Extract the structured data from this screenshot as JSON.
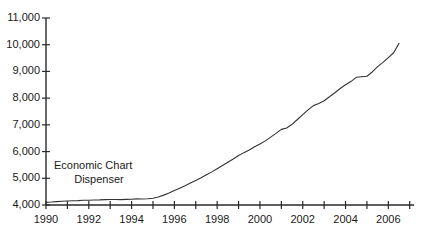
{
  "chart_data": {
    "type": "line",
    "title": "",
    "subtitle": "",
    "xlabel": "",
    "ylabel": "",
    "grid": false,
    "legend": null,
    "xlim": [
      1990,
      2007.2
    ],
    "ylim": [
      4000,
      11000
    ],
    "y_ticks": [
      4000,
      5000,
      6000,
      7000,
      8000,
      9000,
      10000,
      11000
    ],
    "y_tick_labels": [
      "4,000",
      "5,000",
      "6,000",
      "7,000",
      "8,000",
      "9,000",
      "10,000",
      "11,000"
    ],
    "x_ticks": [
      1990,
      1991,
      1992,
      1993,
      1994,
      1995,
      1996,
      1997,
      1998,
      1999,
      2000,
      2001,
      2002,
      2003,
      2004,
      2005,
      2006,
      2007
    ],
    "x_tick_labels": [
      {
        "value": 1990,
        "label": "1990"
      },
      {
        "value": 1992,
        "label": "1992"
      },
      {
        "value": 1994,
        "label": "1994"
      },
      {
        "value": 1996,
        "label": "1996"
      },
      {
        "value": 1998,
        "label": "1998"
      },
      {
        "value": 2000,
        "label": "2000"
      },
      {
        "value": 2002,
        "label": "2002"
      },
      {
        "value": 2004,
        "label": "2004"
      },
      {
        "value": 2006,
        "label": "2006"
      }
    ],
    "annotations": [
      {
        "name": "economic-chart-dispenser",
        "line1": "Economic Chart",
        "line2": "Dispenser"
      }
    ],
    "series": [
      {
        "name": "series-1",
        "color": "#333333",
        "x": [
          1990.0,
          1990.25,
          1990.5,
          1990.75,
          1991.0,
          1991.25,
          1991.5,
          1991.75,
          1992.0,
          1992.25,
          1992.5,
          1992.75,
          1993.0,
          1993.25,
          1993.5,
          1993.75,
          1994.0,
          1994.25,
          1994.5,
          1994.75,
          1995.0,
          1995.25,
          1995.5,
          1995.75,
          1996.0,
          1996.25,
          1996.5,
          1996.75,
          1997.0,
          1997.25,
          1997.5,
          1997.75,
          1998.0,
          1998.25,
          1998.5,
          1998.75,
          1999.0,
          1999.25,
          1999.5,
          1999.75,
          2000.0,
          2000.25,
          2000.5,
          2000.75,
          2001.0,
          2001.25,
          2001.5,
          2001.75,
          2002.0,
          2002.25,
          2002.5,
          2002.75,
          2003.0,
          2003.25,
          2003.5,
          2003.75,
          2004.0,
          2004.25,
          2004.5,
          2004.75,
          2005.0,
          2005.25,
          2005.5,
          2005.75,
          2006.0,
          2006.25,
          2006.5
        ],
        "y": [
          4100,
          4110,
          4125,
          4140,
          4150,
          4160,
          4165,
          4175,
          4180,
          4185,
          4190,
          4200,
          4205,
          4205,
          4200,
          4210,
          4215,
          4230,
          4225,
          4235,
          4250,
          4300,
          4370,
          4450,
          4540,
          4630,
          4720,
          4820,
          4920,
          5020,
          5130,
          5240,
          5360,
          5480,
          5600,
          5720,
          5850,
          5960,
          6060,
          6180,
          6280,
          6400,
          6540,
          6680,
          6830,
          6880,
          7020,
          7200,
          7380,
          7560,
          7720,
          7800,
          7900,
          8050,
          8200,
          8360,
          8500,
          8620,
          8780,
          8800,
          8820,
          8980,
          9180,
          9340,
          9520,
          9700,
          10050
        ]
      }
    ]
  }
}
